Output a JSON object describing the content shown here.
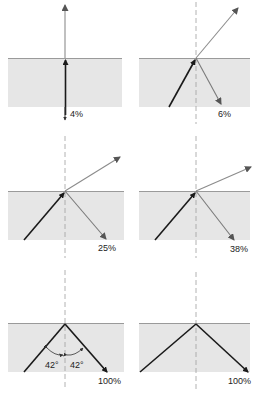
{
  "colors": {
    "water": "#e6e6e6",
    "surface_line": "#9a9a9a",
    "incident_ray": "#1a1a1a",
    "refracted_ray": "#8c8c8c",
    "reflected_ray": "#7a7a7a",
    "normal_line": "#a0a0a0"
  },
  "panels": [
    {
      "id": "p1",
      "reflected_percent": "4%"
    },
    {
      "id": "p2",
      "reflected_percent": "6%"
    },
    {
      "id": "p3",
      "reflected_percent": "25%"
    },
    {
      "id": "p4",
      "reflected_percent": "38%"
    },
    {
      "id": "p5",
      "reflected_percent": "100%",
      "critical_angle_left": "42°",
      "critical_angle_right": "42°"
    },
    {
      "id": "p6",
      "reflected_percent": "100%"
    }
  ]
}
